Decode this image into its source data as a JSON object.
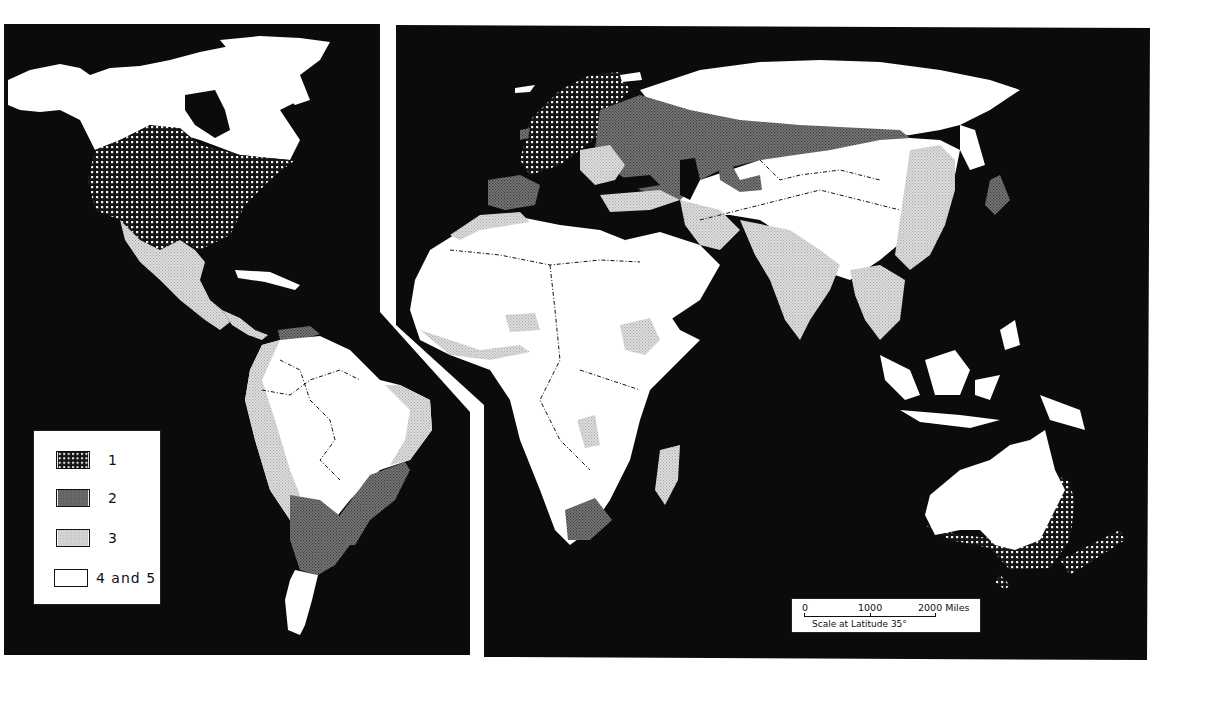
{
  "map": {
    "title": "",
    "panels": [
      "americas",
      "eastern-hemisphere"
    ],
    "colors": {
      "ocean": "#0b0b0b",
      "class1": "#1a1a1a",
      "class2": "#6e6e6e",
      "class3": "#cfcfcf",
      "class4_5": "#ffffff"
    }
  },
  "legend": {
    "items": [
      {
        "label": "1",
        "pattern": "dense-white-dots-on-black"
      },
      {
        "label": "2",
        "pattern": "dark-gray-stipple"
      },
      {
        "label": "3",
        "pattern": "light-gray-stipple"
      },
      {
        "label": "4 and 5",
        "pattern": "white"
      }
    ]
  },
  "scale_bar": {
    "tick_0": "0",
    "tick_1000": "1000",
    "tick_2000": "2000 Miles",
    "caption": "Scale at Latitude 35°"
  }
}
